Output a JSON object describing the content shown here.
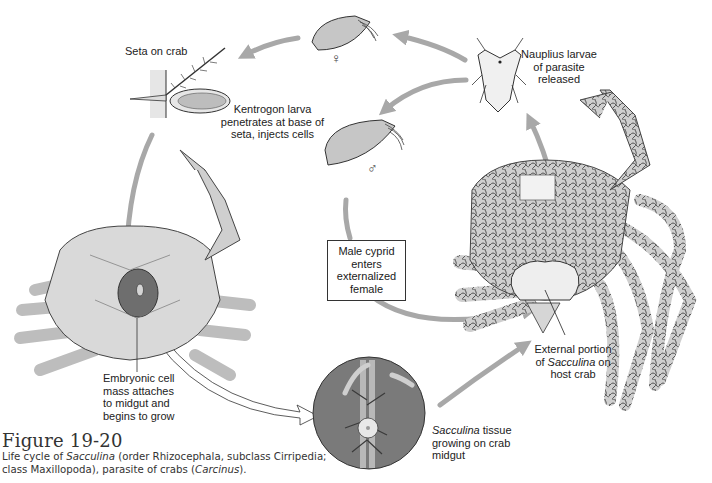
{
  "figure": {
    "number": "Figure 19-20",
    "caption_parts": [
      {
        "text": "Life cycle of ",
        "italic": false
      },
      {
        "text": "Sacculina",
        "italic": true
      },
      {
        "text": " (order Rhizocephala, subclass Cirripedia; class Maxillopoda), parasite of crabs (",
        "italic": false
      },
      {
        "text": "Carcinus",
        "italic": true
      },
      {
        "text": ").",
        "italic": false
      }
    ]
  },
  "labels": {
    "seta": "Seta on crab",
    "kentrogon": [
      "Kentrogon larva",
      "penetrates at base of",
      "seta, injects cells"
    ],
    "nauplius": [
      "Nauplius larvae",
      "of parasite",
      "released"
    ],
    "male_cyprid": [
      "Male cyprid",
      "enters",
      "externalized",
      "female"
    ],
    "embryonic": [
      "Embryonic cell",
      "mass attaches",
      "to midgut and",
      "begins to grow"
    ],
    "tissue": {
      "italic": "Sacculina",
      "rest_line1": " tissue",
      "line2": "growing on crab",
      "line3": "midgut"
    },
    "external": {
      "line1": "External portion",
      "line2_pre": "of ",
      "line2_italic": "Sacculina",
      "line2_post": " on",
      "line3": "host crab"
    }
  },
  "symbols": {
    "female": "♀",
    "male": "♂"
  },
  "colors": {
    "arrow": "#a8a8a8",
    "outline": "#333333",
    "crab_fill": "#d9d9d9",
    "crab_dark": "#6e6e6e",
    "circle_fill": "#7a7a7a",
    "parasite_fill": "#eeeeee"
  }
}
